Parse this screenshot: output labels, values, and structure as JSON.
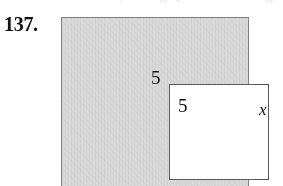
{
  "figure": {
    "problem_number": "137.",
    "outer_square": {
      "label": "x",
      "fill_color": "#d9d9d9",
      "stroke_color": "#808080",
      "description": "large shaded square"
    },
    "inner_square": {
      "top_label": "5",
      "right_label": "5",
      "fill_color": "#ffffff",
      "stroke_color": "#5a5a5a",
      "description": "small white square removed from the shaded square"
    }
  },
  "chart_data": {
    "type": "diagram",
    "title": "137.",
    "shapes": [
      {
        "name": "outer-square",
        "kind": "square",
        "fill": "#d9d9d9",
        "stroke": "#808080",
        "side_label": "x",
        "side_label_position": "right"
      },
      {
        "name": "inner-square",
        "kind": "square",
        "fill": "#ffffff",
        "stroke": "#5a5a5a",
        "side_labels": [
          {
            "value": "5",
            "position": "top"
          },
          {
            "value": "5",
            "position": "right"
          }
        ]
      }
    ],
    "annotations": [
      "137.",
      "5",
      "5",
      "x"
    ]
  }
}
